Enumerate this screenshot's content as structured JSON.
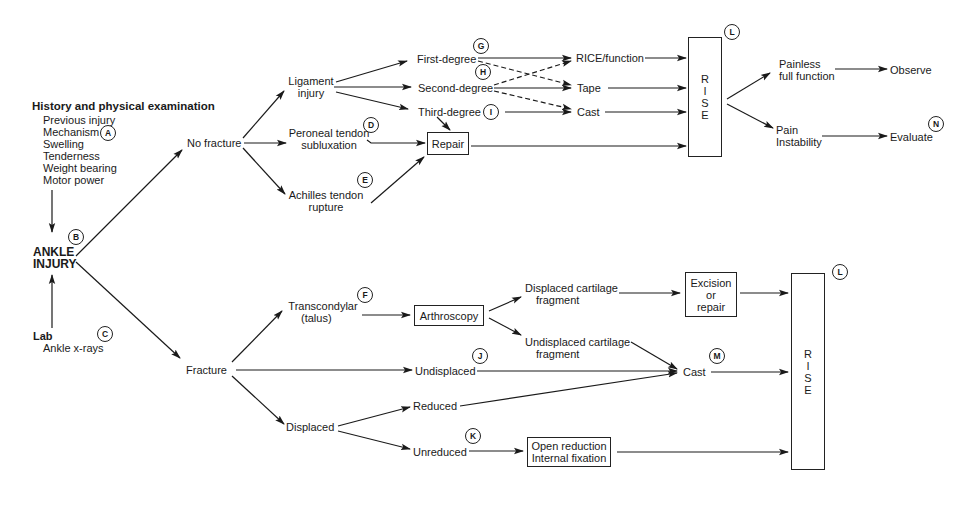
{
  "diagram": {
    "history": {
      "title": "History and physical examination",
      "items": [
        "Previous injury",
        "Mechanism",
        "Swelling",
        "Tenderness",
        "Weight bearing",
        "Motor power"
      ]
    },
    "root": {
      "line1": "ANKLE",
      "line2": "INJURY"
    },
    "lab": {
      "title": "Lab",
      "item": "Ankle x-rays"
    },
    "no_fracture": {
      "label": "No fracture",
      "ligament": {
        "line1": "Ligament",
        "line2": "injury"
      },
      "grades": [
        "First-degree",
        "Second-degree",
        "Third-degree"
      ],
      "treatments": [
        "RICE/function",
        "Tape",
        "Cast"
      ],
      "peroneal": {
        "line1": "Peroneal tendon",
        "line2": "subluxation"
      },
      "achilles": {
        "line1": "Achilles tendon",
        "line2": "rupture"
      },
      "repair_box": "Repair",
      "rise_letters": [
        "R",
        "I",
        "S",
        "E"
      ],
      "outcomes": [
        {
          "line1": "Painless",
          "line2": "full function",
          "action": "Observe"
        },
        {
          "line1": "Pain",
          "line2": "Instability",
          "action": "Evaluate"
        }
      ]
    },
    "fracture": {
      "label": "Fracture",
      "transcondylar": {
        "line1": "Transcondylar",
        "line2": "(talus)"
      },
      "arthroscopy_box": "Arthroscopy",
      "displaced_cartilage": {
        "line1": "Displaced cartilage",
        "line2": "fragment"
      },
      "undisplaced_cartilage": {
        "line1": "Undisplaced cartilage",
        "line2": "fragment"
      },
      "excision_box": {
        "line1": "Excision",
        "line2": "or",
        "line3": "repair"
      },
      "undisplaced": "Undisplaced",
      "displaced": "Displaced",
      "reduced": "Reduced",
      "unreduced": "Unreduced",
      "orif_box": {
        "line1": "Open reduction",
        "line2": "Internal fixation"
      },
      "cast": "Cast",
      "rise_letters": [
        "R",
        "I",
        "S",
        "E"
      ]
    },
    "markers": {
      "A": "A",
      "B": "B",
      "C": "C",
      "D": "D",
      "E": "E",
      "F": "F",
      "G": "G",
      "H": "H",
      "I": "I",
      "J": "J",
      "K": "K",
      "L": "L",
      "M": "M",
      "N": "N"
    }
  }
}
